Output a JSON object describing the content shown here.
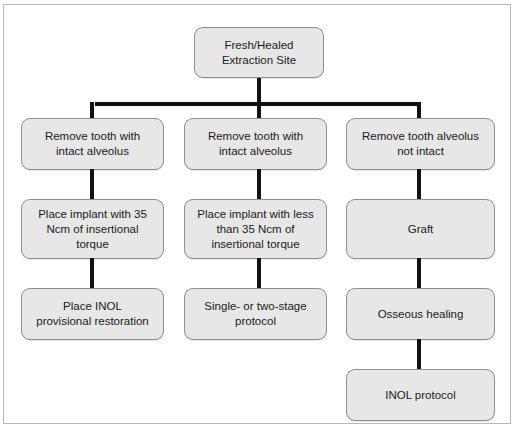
{
  "figure": {
    "type": "flowchart",
    "orientation": "top-down",
    "columns": 3,
    "frame_border_color": "#b9b9b9",
    "node_fill_color": "#e7e7e7",
    "node_border_color": "#8f8f8f",
    "connector_color": "#111111"
  },
  "nodes": {
    "root": "Fresh/Healed\nExtraction Site",
    "col1": {
      "row1": "Remove tooth with\nintact alveolus",
      "row2": "Place implant with 35\nNcm of insertional\ntorque",
      "row3": "Place INOL\nprovisional restoration"
    },
    "col2": {
      "row1": "Remove tooth with\nintact alveolus",
      "row2": "Place implant with less\nthan 35 Ncm of\ninsertional torque",
      "row3": "Single- or two-stage\nprotocol"
    },
    "col3": {
      "row1": "Remove tooth alveolus\nnot intact",
      "row2": "Graft",
      "row3": "Osseous healing",
      "row4": "INOL protocol"
    }
  }
}
